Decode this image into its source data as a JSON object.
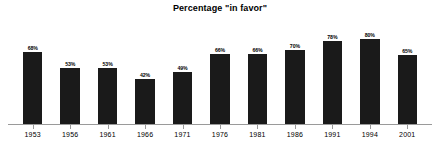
{
  "chart_data": {
    "type": "bar",
    "title": "Percentage \"in favor\"",
    "xlabel": "",
    "ylabel": "",
    "ylim": [
      0,
      100
    ],
    "grid": false,
    "legend": null,
    "bar_color": "#1a1a1a",
    "axis_color": "#9a9a9a",
    "background": "#ffffff",
    "value_label_suffix": "%",
    "categories": [
      "1953",
      "1956",
      "1961",
      "1966",
      "1971",
      "1976",
      "1981",
      "1986",
      "1991",
      "1994",
      "2001"
    ],
    "values": [
      68,
      53,
      53,
      42,
      49,
      66,
      66,
      70,
      78,
      80,
      65
    ],
    "value_labels": [
      "68%",
      "53%",
      "53%",
      "42%",
      "49%",
      "66%",
      "66%",
      "70%",
      "78%",
      "80%",
      "65%"
    ]
  }
}
